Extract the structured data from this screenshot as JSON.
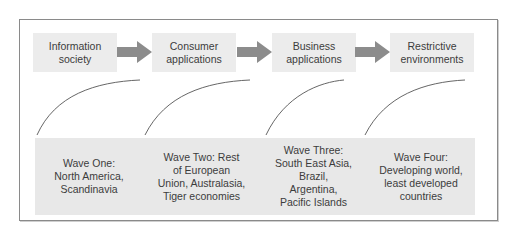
{
  "diagram": {
    "stages": [
      {
        "label": "Information\nsociety"
      },
      {
        "label": "Consumer\napplications"
      },
      {
        "label": "Business\napplications"
      },
      {
        "label": "Restrictive\nenvironments"
      }
    ],
    "waves": [
      {
        "label": "Wave One:\nNorth America,\nScandinavia"
      },
      {
        "label": "Wave Two: Rest\nof European\nUnion, Australasia,\nTiger economies"
      },
      {
        "label": "Wave Three:\nSouth East Asia,\nBrazil,\nArgentina,\nPacific Islands"
      },
      {
        "label": "Wave Four:\nDeveloping world,\nleast developed\ncountries"
      }
    ],
    "colors": {
      "box_fill": "#ececec",
      "band_fill": "#e8e8e8",
      "arrow_fill": "#8c8c8c",
      "curve_stroke": "#555555",
      "frame_border": "#8a8a8a"
    }
  }
}
